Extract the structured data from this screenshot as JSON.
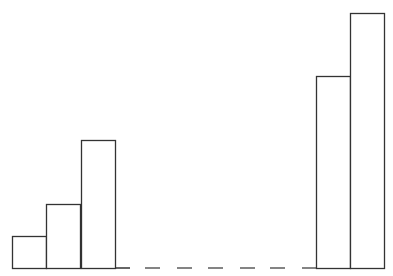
{
  "chart_data": {
    "type": "bar",
    "title": "",
    "xlabel": "",
    "ylabel": "",
    "grid": false,
    "legend": null,
    "annotations": [
      "dashed baseline segment indicating elided bars between groups"
    ],
    "groups": [
      {
        "name": "left",
        "values": [
          1,
          2,
          4
        ]
      },
      {
        "name": "right",
        "values": [
          6,
          8
        ]
      }
    ],
    "categories": [
      "1",
      "2",
      "3",
      "n-1",
      "n"
    ],
    "values": [
      1,
      2,
      4,
      6,
      8
    ],
    "ylim": [
      0,
      8
    ]
  },
  "style": {
    "stroke": "#333333",
    "fill": "#ffffff",
    "background": "#ffffff"
  },
  "layout": {
    "baseline_y": 268,
    "unit_px": 32,
    "bar_width": 34,
    "bars_x": [
      12,
      46,
      81,
      316,
      350
    ],
    "solid_left": [
      12,
      130
    ],
    "dashes": [
      [
        145,
        160
      ],
      [
        177,
        192
      ],
      [
        208,
        223
      ],
      [
        240,
        255
      ],
      [
        270,
        285
      ],
      [
        302,
        316
      ]
    ]
  }
}
